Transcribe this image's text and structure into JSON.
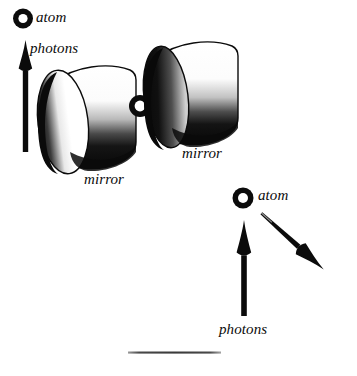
{
  "figure": {
    "background_color": "#ffffff",
    "ink_color": "#0b0b0b",
    "width": 357,
    "height": 376
  },
  "labels": {
    "atom_top": "atom",
    "photons_top": "photons",
    "mirror_left": "mirror",
    "mirror_right": "mirror",
    "atom_bottom": "atom",
    "photons_bottom": "photons"
  },
  "objects": {
    "atom_top_icon": "atom-ring-icon",
    "atom_cavity_icon": "atom-ring-icon",
    "atom_bottom_icon": "atom-ring-icon",
    "photon_arrow_top": "up-arrow-icon",
    "photon_arrow_bottom": "up-arrow-icon",
    "photon_arrow_diagonal": "down-right-arrow-icon",
    "mirror_left_shape": "cylinder-mirror",
    "mirror_right_shape": "cylinder-mirror",
    "baseline_rule": "horizontal-rule"
  },
  "scene": {
    "top_panel_description": "An atom between two facing cylindrical mirrors emits photons upward",
    "bottom_panel_description": "A free atom emits photons upward and in a diagonal direction"
  }
}
